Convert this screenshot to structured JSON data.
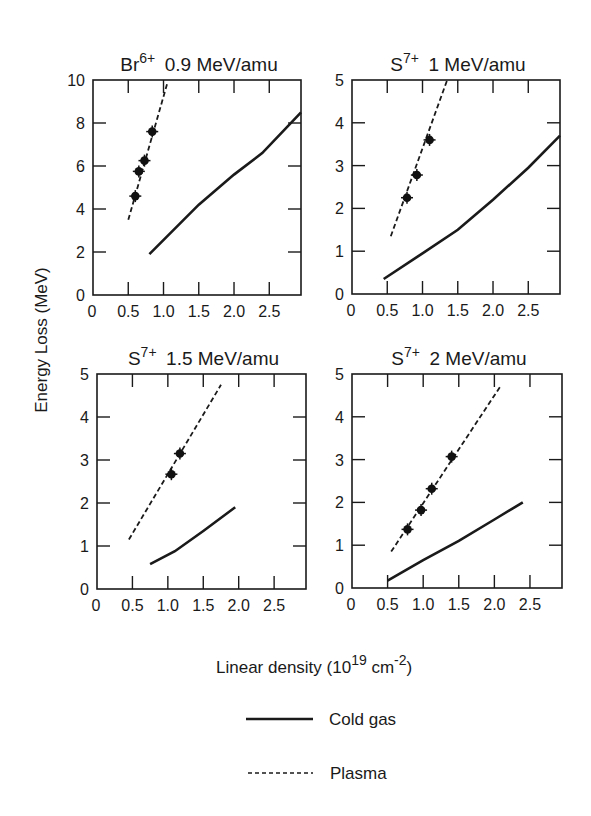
{
  "figure": {
    "ylabel": "Energy Loss (MeV)",
    "xlabel_main": "Linear density (10",
    "xlabel_exp1": "19",
    "xlabel_mid": " cm",
    "xlabel_exp2": "-2",
    "xlabel_end": ")",
    "legend": {
      "cold_gas": "Cold gas",
      "plasma": "Plasma"
    }
  },
  "chart_data": [
    {
      "type": "line",
      "title_ion": "Br",
      "title_charge": "6+",
      "title_energy": "0.9 MeV/amu",
      "xlabel": "Linear density (10^19 cm^-2)",
      "ylabel": "Energy Loss (MeV)",
      "xlim": [
        0,
        2.95
      ],
      "ylim": [
        0,
        10
      ],
      "xticks": [
        "0",
        "0.5",
        "1.0",
        "1.5",
        "2.0",
        "2.5"
      ],
      "yticks": [
        "0",
        "2",
        "4",
        "6",
        "8",
        "10"
      ],
      "series": [
        {
          "name": "Cold gas",
          "style": "solid",
          "x": [
            0.8,
            1.5,
            2.0,
            2.4,
            2.95
          ],
          "y": [
            1.9,
            4.2,
            5.6,
            6.6,
            8.5
          ]
        },
        {
          "name": "Plasma",
          "style": "dashed",
          "x": [
            0.5,
            1.05
          ],
          "y": [
            3.5,
            9.8
          ]
        },
        {
          "name": "Data",
          "style": "markers",
          "x": [
            0.6,
            0.65,
            0.73,
            0.84
          ],
          "y": [
            4.6,
            5.75,
            6.25,
            7.6
          ]
        }
      ]
    },
    {
      "type": "line",
      "title_ion": "S",
      "title_charge": "7+",
      "title_energy": "1 MeV/amu",
      "xlabel": "Linear density (10^19 cm^-2)",
      "ylabel": "Energy Loss (MeV)",
      "xlim": [
        0,
        2.95
      ],
      "ylim": [
        0,
        5
      ],
      "xticks": [
        "0",
        "0.5",
        "1.0",
        "1.5",
        "2.0",
        "2.5"
      ],
      "yticks": [
        "0",
        "1",
        "2",
        "3",
        "4",
        "5"
      ],
      "series": [
        {
          "name": "Cold gas",
          "style": "solid",
          "x": [
            0.45,
            1.0,
            1.5,
            2.0,
            2.5,
            2.95
          ],
          "y": [
            0.35,
            0.95,
            1.5,
            2.2,
            2.95,
            3.7
          ]
        },
        {
          "name": "Plasma",
          "style": "dashed",
          "x": [
            0.55,
            1.35
          ],
          "y": [
            1.35,
            5.0
          ]
        },
        {
          "name": "Data",
          "style": "markers",
          "x": [
            0.78,
            0.92,
            1.1
          ],
          "y": [
            2.25,
            2.78,
            3.6
          ]
        }
      ]
    },
    {
      "type": "line",
      "title_ion": "S",
      "title_charge": "7+",
      "title_energy": "1.5 MeV/amu",
      "xlabel": "Linear density (10^19 cm^-2)",
      "ylabel": "Energy Loss (MeV)",
      "xlim": [
        0,
        2.95
      ],
      "ylim": [
        0,
        5
      ],
      "xticks": [
        "0",
        "0.5",
        "1.0",
        "1.5",
        "2.0",
        "2.5"
      ],
      "yticks": [
        "0",
        "1",
        "2",
        "3",
        "4",
        "5"
      ],
      "series": [
        {
          "name": "Cold gas",
          "style": "solid",
          "x": [
            0.75,
            1.1,
            1.5,
            1.95
          ],
          "y": [
            0.58,
            0.88,
            1.35,
            1.9
          ]
        },
        {
          "name": "Plasma",
          "style": "dashed",
          "x": [
            0.45,
            1.75
          ],
          "y": [
            1.15,
            4.75
          ]
        },
        {
          "name": "Data",
          "style": "markers",
          "x": [
            1.05,
            1.17
          ],
          "y": [
            2.67,
            3.15
          ]
        }
      ]
    },
    {
      "type": "line",
      "title_ion": "S",
      "title_charge": "7+",
      "title_energy": "2 MeV/amu",
      "xlabel": "Linear density (10^19 cm^-2)",
      "ylabel": "Energy Loss (MeV)",
      "xlim": [
        0,
        2.95
      ],
      "ylim": [
        0,
        5
      ],
      "xticks": [
        "0",
        "0.5",
        "1.0",
        "1.5",
        "2.0",
        "2.5"
      ],
      "yticks": [
        "0",
        "1",
        "2",
        "3",
        "4",
        "5"
      ],
      "series": [
        {
          "name": "Cold gas",
          "style": "solid",
          "x": [
            0.5,
            1.0,
            1.5,
            2.0,
            2.4
          ],
          "y": [
            0.17,
            0.65,
            1.1,
            1.6,
            2.0
          ]
        },
        {
          "name": "Plasma",
          "style": "dashed",
          "x": [
            0.55,
            2.1
          ],
          "y": [
            0.85,
            4.75
          ]
        },
        {
          "name": "Data",
          "style": "markers",
          "x": [
            0.78,
            0.97,
            1.12,
            1.4
          ],
          "y": [
            1.37,
            1.82,
            2.32,
            3.07
          ]
        }
      ]
    }
  ]
}
